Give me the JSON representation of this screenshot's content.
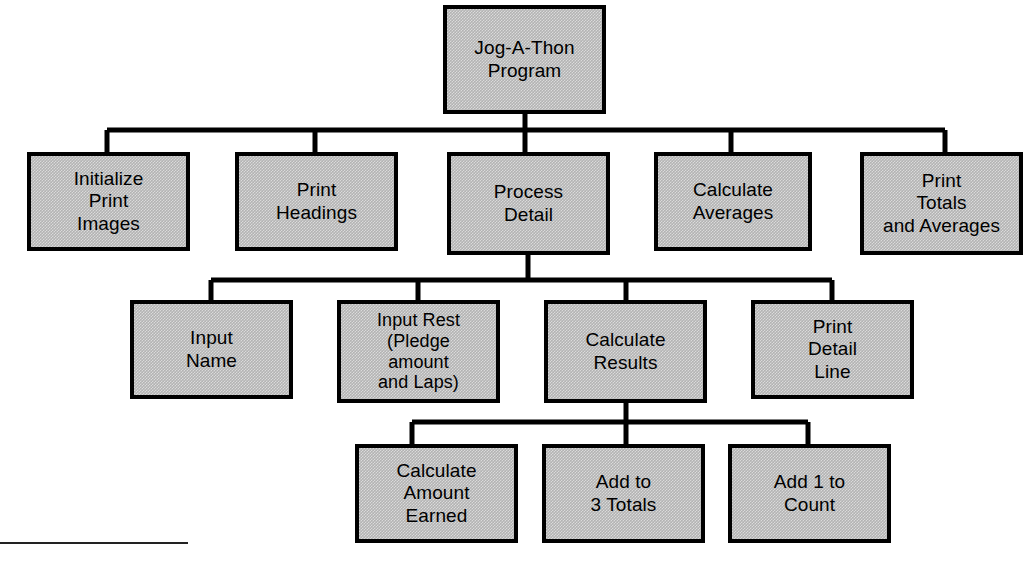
{
  "diagram": {
    "type": "structure-chart",
    "box_fill_color": "#b3b3b3",
    "box_border_color": "#000000",
    "connector_color": "#000000",
    "background_color": "#ffffff"
  },
  "nodes": {
    "root": {
      "label": "Jog-A-Thon\nProgram",
      "x": 443,
      "y": 5,
      "w": 163,
      "h": 109,
      "level": 0
    },
    "initialize_print_images": {
      "label": "Initialize\nPrint\nImages",
      "x": 27,
      "y": 152,
      "w": 163,
      "h": 99,
      "level": 1
    },
    "print_headings": {
      "label": "Print\nHeadings",
      "x": 235,
      "y": 152,
      "w": 163,
      "h": 99,
      "level": 1
    },
    "process_detail": {
      "label": "Process\nDetail",
      "x": 447,
      "y": 152,
      "w": 163,
      "h": 103,
      "level": 1
    },
    "calculate_averages": {
      "label": "Calculate\nAverages",
      "x": 654,
      "y": 152,
      "w": 158,
      "h": 99,
      "level": 1
    },
    "print_totals_and_averages": {
      "label": "Print\nTotals\nand Averages",
      "x": 860,
      "y": 152,
      "w": 163,
      "h": 103,
      "level": 1
    },
    "input_name": {
      "label": "Input\nName",
      "x": 130,
      "y": 300,
      "w": 163,
      "h": 99,
      "level": 2
    },
    "input_rest": {
      "label": "Input Rest\n(Pledge\namount\nand Laps)",
      "x": 337,
      "y": 300,
      "w": 163,
      "h": 103,
      "level": 2
    },
    "calculate_results": {
      "label": "Calculate\nResults",
      "x": 544,
      "y": 300,
      "w": 163,
      "h": 103,
      "level": 2
    },
    "print_detail_line": {
      "label": "Print\nDetail\nLine",
      "x": 751,
      "y": 300,
      "w": 163,
      "h": 99,
      "level": 2
    },
    "calculate_amount_earned": {
      "label": "Calculate\nAmount\nEarned",
      "x": 355,
      "y": 444,
      "w": 163,
      "h": 99,
      "level": 3
    },
    "add_to_3_totals": {
      "label": "Add to\n3 Totals",
      "x": 542,
      "y": 444,
      "w": 163,
      "h": 99,
      "level": 3
    },
    "add_1_to_count": {
      "label": "Add 1 to\nCount",
      "x": 728,
      "y": 444,
      "w": 163,
      "h": 99,
      "level": 3
    }
  },
  "connectors": {
    "bus_level1": {
      "parent": "root",
      "y_bus": 130,
      "x_from": 107,
      "x_to": 945
    },
    "bus_level2": {
      "parent": "process_detail",
      "y_bus": 280,
      "x_from": 211,
      "x_to": 832
    },
    "bus_level3": {
      "parent": "calculate_results",
      "y_bus": 422,
      "x_from": 412,
      "x_to": 808
    }
  },
  "footer": {
    "rule_label": "footnote-rule"
  }
}
